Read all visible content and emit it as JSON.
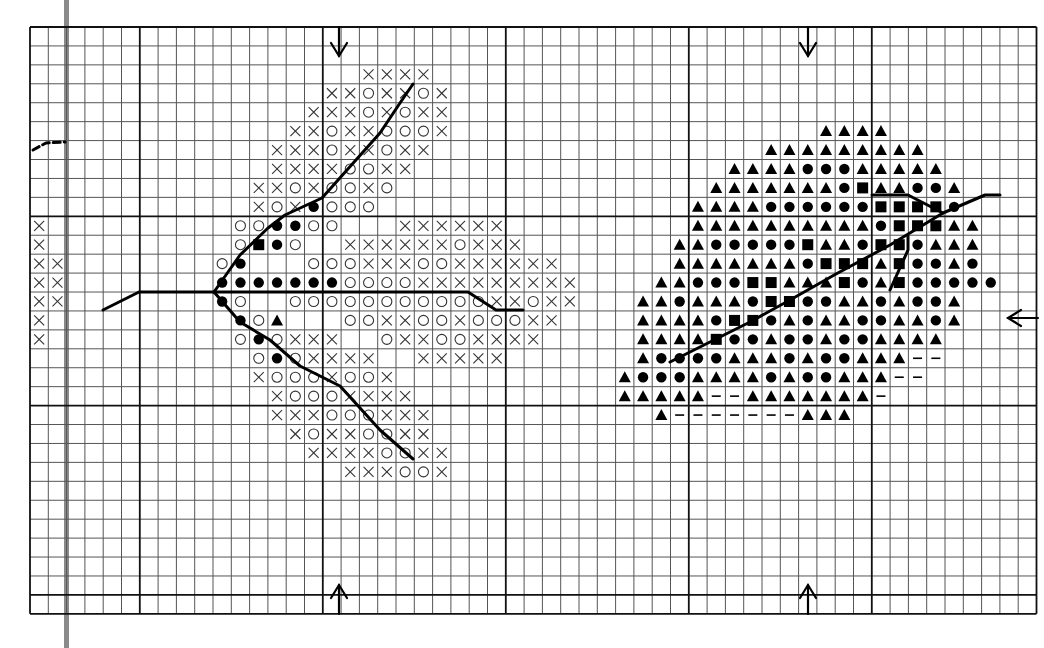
{
  "pattern": {
    "title": "",
    "grid": {
      "cols": 55,
      "rows": 31,
      "origin_x": 30,
      "origin_y": 27,
      "cell_w": 18.3,
      "cell_h": 18.93,
      "major_col_offset": 6,
      "major_row_offset": 0,
      "major_every": 10,
      "line_color": "#555555",
      "major_color": "#111111"
    },
    "legend_symbols": {
      "x": "cross",
      "o": "open-circle",
      "d": "filled-circle",
      "s": "filled-square",
      "t": "filled-triangle",
      "-": "dash"
    },
    "rows": [
      {
        "r": 2,
        "c": 18,
        "cells": "xxxx"
      },
      {
        "r": 3,
        "c": 16,
        "cells": "xxoxxox"
      },
      {
        "r": 4,
        "c": 15,
        "cells": "xxxoxoxx"
      },
      {
        "r": 5,
        "c": 14,
        "cells": "xxoxxooox"
      },
      {
        "r": 6,
        "c": 13,
        "cells": "xxxoxxoxx"
      },
      {
        "r": 7,
        "c": 13,
        "cells": "xxxxooxx"
      },
      {
        "r": 8,
        "c": 12,
        "cells": "xxoxooxo"
      },
      {
        "r": 9,
        "c": 12,
        "cells": "xoxdooo"
      },
      {
        "r": 10,
        "c": 11,
        "cells": "ooddoo...xxxxxx"
      },
      {
        "r": 11,
        "c": 11,
        "cells": "osdo..xxxxxxoxxx"
      },
      {
        "r": 12,
        "c": 10,
        "cells": "od...oooxxxooxxxxxx"
      },
      {
        "r": 13,
        "c": 10,
        "cells": "dddddddooooxxxxxxxxx"
      },
      {
        "r": 14,
        "c": 10,
        "cells": "do..oooooooooooxxoxx"
      },
      {
        "r": 15,
        "c": 11,
        "cells": "dot...ooxxooxoooxx"
      },
      {
        "r": 16,
        "c": 11,
        "cells": "odoxxx..oxxooxxxx"
      },
      {
        "r": 17,
        "c": 12,
        "cells": "odoxxxx..xxxxx"
      },
      {
        "r": 18,
        "c": 12,
        "cells": "xoooxoox"
      },
      {
        "r": 19,
        "c": 13,
        "cells": "xoooxxxx"
      },
      {
        "r": 20,
        "c": 13,
        "cells": "xxxoooxxx"
      },
      {
        "r": 21,
        "c": 14,
        "cells": "xoxxooxx"
      },
      {
        "r": 22,
        "c": 15,
        "cells": "xxxxooxx"
      },
      {
        "r": 23,
        "c": 17,
        "cells": "xxxoox"
      },
      {
        "r": 10,
        "c": 0,
        "cells": "x"
      },
      {
        "r": 11,
        "c": 0,
        "cells": "x"
      },
      {
        "r": 12,
        "c": 0,
        "cells": "xx"
      },
      {
        "r": 13,
        "c": 0,
        "cells": "xx"
      },
      {
        "r": 14,
        "c": 0,
        "cells": "xx"
      },
      {
        "r": 15,
        "c": 0,
        "cells": "x"
      },
      {
        "r": 16,
        "c": 0,
        "cells": "x"
      },
      {
        "r": 5,
        "c": 43,
        "cells": "tttt"
      },
      {
        "r": 6,
        "c": 40,
        "cells": "ttttttttt"
      },
      {
        "r": 7,
        "c": 38,
        "cells": "ttttdddttttt"
      },
      {
        "r": 8,
        "c": 37,
        "cells": "tttttttdsttddt"
      },
      {
        "r": 9,
        "c": 36,
        "cells": "ttttddddddssssd"
      },
      {
        "r": 10,
        "c": 36,
        "cells": "ttttttttttdssstt"
      },
      {
        "r": 11,
        "c": 35,
        "cells": "ttdddddsttdssdttt"
      },
      {
        "r": 12,
        "c": 35,
        "cells": "tttttttdssstsddtd"
      },
      {
        "r": 13,
        "c": 34,
        "cells": "ttdddsstttsdtsddddd"
      },
      {
        "r": 14,
        "c": 33,
        "cells": "ttdtttdssddttdtddt"
      },
      {
        "r": 15,
        "c": 33,
        "cells": "ttttdssdtdttddttdt"
      },
      {
        "r": 16,
        "c": 33,
        "cells": "ttttsddtddtddtttt"
      },
      {
        "r": 17,
        "c": 33,
        "cells": "tddddtttdtddttt--"
      },
      {
        "r": 18,
        "c": 32,
        "cells": "tdddttttdtddttt--"
      },
      {
        "r": 19,
        "c": 32,
        "cells": "ttttt--ttttttt-"
      },
      {
        "r": 20,
        "c": 34,
        "cells": "t-------ttt"
      }
    ],
    "backstitch_lines": [
      {
        "name": "left-leaf-stem",
        "points": [
          [
            103,
            310
          ],
          [
            139,
            292
          ],
          [
            214,
            292
          ],
          [
            468,
            292
          ],
          [
            496,
            310
          ],
          [
            523,
            310
          ]
        ]
      },
      {
        "name": "left-leaf-upper-vein",
        "points": [
          [
            214,
            292
          ],
          [
            240,
            255
          ],
          [
            268,
            228
          ],
          [
            285,
            215
          ],
          [
            322,
            198
          ],
          [
            380,
            133
          ],
          [
            400,
            103
          ],
          [
            413,
            84
          ]
        ]
      },
      {
        "name": "left-leaf-lower-vein",
        "points": [
          [
            214,
            292
          ],
          [
            240,
            322
          ],
          [
            270,
            340
          ],
          [
            300,
            366
          ],
          [
            322,
            377
          ],
          [
            340,
            386
          ],
          [
            380,
            430
          ],
          [
            413,
            459
          ]
        ]
      },
      {
        "name": "right-leaf-main-vein",
        "points": [
          [
            670,
            362
          ],
          [
            710,
            342
          ],
          [
            750,
            322
          ],
          [
            790,
            300
          ],
          [
            836,
            274
          ],
          [
            890,
            245
          ],
          [
            943,
            213
          ],
          [
            985,
            195
          ],
          [
            1000,
            195
          ]
        ]
      },
      {
        "name": "right-leaf-upper-vein",
        "points": [
          [
            872,
            195
          ],
          [
            908,
            195
          ],
          [
            943,
            213
          ]
        ]
      },
      {
        "name": "right-leaf-lower-vein",
        "points": [
          [
            908,
            236
          ],
          [
            908,
            250
          ],
          [
            890,
            290
          ]
        ]
      },
      {
        "name": "left-edge-dashed-curve",
        "dashed": true,
        "points": [
          [
            33,
            150
          ],
          [
            46,
            143
          ],
          [
            65,
            142
          ]
        ]
      }
    ],
    "center_arrows": [
      {
        "name": "top-arrow-left",
        "dir": "down",
        "x": 339,
        "y1": 27,
        "y2": 56
      },
      {
        "name": "top-arrow-right",
        "dir": "down",
        "x": 808,
        "y1": 27,
        "y2": 56
      },
      {
        "name": "bottom-arrow-left",
        "dir": "up",
        "x": 339,
        "y1": 585,
        "y2": 614
      },
      {
        "name": "bottom-arrow-right",
        "dir": "up",
        "x": 808,
        "y1": 585,
        "y2": 614
      },
      {
        "name": "right-arrow",
        "dir": "left",
        "y": 318,
        "x1": 1008,
        "x2": 1038
      }
    ]
  }
}
